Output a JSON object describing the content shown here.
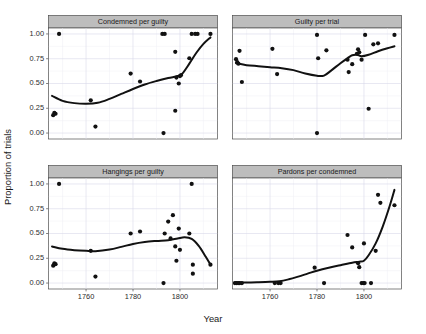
{
  "figure": {
    "xlabel": "Year",
    "ylabel": "Proportion of trials",
    "background": "#ffffff",
    "strip_fill": "#bdbdbd",
    "point_color": "#111111",
    "line_color": "#111111",
    "grid_color": "#d9d9ea"
  },
  "chart_data": {
    "type": "scatter",
    "title": "",
    "subtitle": "",
    "xlabel": "Year",
    "ylabel": "Proportion of trials",
    "xlim": [
      1744,
      1816
    ],
    "ylim": [
      -0.06,
      1.06
    ],
    "xticks": [
      1760,
      1780,
      1800
    ],
    "xtick_labels": [
      "1760",
      "1780",
      "1800"
    ],
    "yticks": [
      0.0,
      0.25,
      0.5,
      0.75,
      1.0
    ],
    "ytick_labels": [
      "0.00",
      "0.25",
      "0.50",
      "0.75",
      "1.00"
    ],
    "grid": true,
    "legend": "none",
    "facet_layout": [
      2,
      2
    ],
    "panels": [
      {
        "label": "Condemned per guilty",
        "row": 0,
        "col": 0,
        "points": [
          {
            "x": 1746,
            "y": 0.18
          },
          {
            "x": 1746.5,
            "y": 0.205
          },
          {
            "x": 1747,
            "y": 0.195
          },
          {
            "x": 1748.5,
            "y": 1.0
          },
          {
            "x": 1762,
            "y": 0.33
          },
          {
            "x": 1764,
            "y": 0.065
          },
          {
            "x": 1779,
            "y": 0.6
          },
          {
            "x": 1783,
            "y": 0.52
          },
          {
            "x": 1792.5,
            "y": 1.0
          },
          {
            "x": 1793.5,
            "y": 1.0
          },
          {
            "x": 1793,
            "y": 0.0
          },
          {
            "x": 1798,
            "y": 0.82
          },
          {
            "x": 1798,
            "y": 0.225
          },
          {
            "x": 1798.5,
            "y": 0.56
          },
          {
            "x": 1799.5,
            "y": 0.5
          },
          {
            "x": 1800,
            "y": 0.575
          },
          {
            "x": 1800.5,
            "y": 0.585
          },
          {
            "x": 1804,
            "y": 0.755
          },
          {
            "x": 1805,
            "y": 1.0
          },
          {
            "x": 1806.5,
            "y": 1.0
          },
          {
            "x": 1807.5,
            "y": 1.0
          },
          {
            "x": 1813,
            "y": 1.0
          }
        ],
        "smooth": [
          {
            "x": 1745.5,
            "y": 0.375
          },
          {
            "x": 1750,
            "y": 0.325
          },
          {
            "x": 1755,
            "y": 0.302
          },
          {
            "x": 1760,
            "y": 0.295
          },
          {
            "x": 1765,
            "y": 0.305
          },
          {
            "x": 1770,
            "y": 0.345
          },
          {
            "x": 1775,
            "y": 0.395
          },
          {
            "x": 1780,
            "y": 0.445
          },
          {
            "x": 1785,
            "y": 0.49
          },
          {
            "x": 1790,
            "y": 0.525
          },
          {
            "x": 1795,
            "y": 0.555
          },
          {
            "x": 1799,
            "y": 0.575
          },
          {
            "x": 1801,
            "y": 0.6
          },
          {
            "x": 1804,
            "y": 0.7
          },
          {
            "x": 1807,
            "y": 0.81
          },
          {
            "x": 1810,
            "y": 0.9
          },
          {
            "x": 1813,
            "y": 0.965
          }
        ]
      },
      {
        "label": "Guilty per trial",
        "row": 0,
        "col": 1,
        "points": [
          {
            "x": 1745.5,
            "y": 0.745
          },
          {
            "x": 1746,
            "y": 0.715
          },
          {
            "x": 1746.5,
            "y": 0.7
          },
          {
            "x": 1747,
            "y": 0.83
          },
          {
            "x": 1748,
            "y": 0.515
          },
          {
            "x": 1761,
            "y": 0.85
          },
          {
            "x": 1763,
            "y": 0.595
          },
          {
            "x": 1780,
            "y": 0.99
          },
          {
            "x": 1780.5,
            "y": 0.755
          },
          {
            "x": 1780,
            "y": 0.0
          },
          {
            "x": 1784,
            "y": 0.835
          },
          {
            "x": 1793,
            "y": 0.74
          },
          {
            "x": 1793.5,
            "y": 0.615
          },
          {
            "x": 1795,
            "y": 0.695
          },
          {
            "x": 1797,
            "y": 0.8
          },
          {
            "x": 1797.5,
            "y": 0.845
          },
          {
            "x": 1798,
            "y": 0.815
          },
          {
            "x": 1799,
            "y": 0.74
          },
          {
            "x": 1800.5,
            "y": 0.99
          },
          {
            "x": 1802,
            "y": 0.245
          },
          {
            "x": 1804,
            "y": 0.895
          },
          {
            "x": 1806,
            "y": 0.905
          },
          {
            "x": 1813,
            "y": 0.99
          }
        ],
        "smooth": [
          {
            "x": 1745.5,
            "y": 0.705
          },
          {
            "x": 1750,
            "y": 0.685
          },
          {
            "x": 1755,
            "y": 0.675
          },
          {
            "x": 1760,
            "y": 0.665
          },
          {
            "x": 1765,
            "y": 0.655
          },
          {
            "x": 1770,
            "y": 0.635
          },
          {
            "x": 1775,
            "y": 0.6
          },
          {
            "x": 1780,
            "y": 0.578
          },
          {
            "x": 1783,
            "y": 0.58
          },
          {
            "x": 1786,
            "y": 0.63
          },
          {
            "x": 1790,
            "y": 0.705
          },
          {
            "x": 1793,
            "y": 0.755
          },
          {
            "x": 1795,
            "y": 0.785
          },
          {
            "x": 1797,
            "y": 0.79
          },
          {
            "x": 1799,
            "y": 0.775
          },
          {
            "x": 1802,
            "y": 0.79
          },
          {
            "x": 1806,
            "y": 0.825
          },
          {
            "x": 1810,
            "y": 0.855
          },
          {
            "x": 1813,
            "y": 0.875
          }
        ]
      },
      {
        "label": "Hangings per guilty",
        "row": 1,
        "col": 0,
        "points": [
          {
            "x": 1746,
            "y": 0.175
          },
          {
            "x": 1746.5,
            "y": 0.2
          },
          {
            "x": 1747,
            "y": 0.19
          },
          {
            "x": 1748.5,
            "y": 1.0
          },
          {
            "x": 1762,
            "y": 0.325
          },
          {
            "x": 1764,
            "y": 0.065
          },
          {
            "x": 1779,
            "y": 0.5
          },
          {
            "x": 1783,
            "y": 0.52
          },
          {
            "x": 1793,
            "y": 0.0
          },
          {
            "x": 1793.5,
            "y": 0.5
          },
          {
            "x": 1795,
            "y": 0.62
          },
          {
            "x": 1796,
            "y": 0.45
          },
          {
            "x": 1797,
            "y": 0.685
          },
          {
            "x": 1798,
            "y": 0.37
          },
          {
            "x": 1798.5,
            "y": 0.225
          },
          {
            "x": 1799.5,
            "y": 0.55
          },
          {
            "x": 1800,
            "y": 0.335
          },
          {
            "x": 1804,
            "y": 0.5
          },
          {
            "x": 1805,
            "y": 1.0
          },
          {
            "x": 1805.5,
            "y": 0.185
          },
          {
            "x": 1805.5,
            "y": 0.095
          },
          {
            "x": 1813,
            "y": 0.185
          }
        ],
        "smooth": [
          {
            "x": 1745.5,
            "y": 0.368
          },
          {
            "x": 1750,
            "y": 0.345
          },
          {
            "x": 1755,
            "y": 0.332
          },
          {
            "x": 1760,
            "y": 0.325
          },
          {
            "x": 1764,
            "y": 0.322
          },
          {
            "x": 1770,
            "y": 0.338
          },
          {
            "x": 1775,
            "y": 0.365
          },
          {
            "x": 1780,
            "y": 0.395
          },
          {
            "x": 1785,
            "y": 0.415
          },
          {
            "x": 1790,
            "y": 0.425
          },
          {
            "x": 1795,
            "y": 0.432
          },
          {
            "x": 1799,
            "y": 0.45
          },
          {
            "x": 1802,
            "y": 0.462
          },
          {
            "x": 1805,
            "y": 0.445
          },
          {
            "x": 1808,
            "y": 0.375
          },
          {
            "x": 1811,
            "y": 0.265
          },
          {
            "x": 1813,
            "y": 0.185
          }
        ]
      },
      {
        "label": "Pardons per condemned",
        "row": 1,
        "col": 1,
        "points": [
          {
            "x": 1745,
            "y": 0.0
          },
          {
            "x": 1745.7,
            "y": 0.0
          },
          {
            "x": 1746.4,
            "y": 0.0
          },
          {
            "x": 1747.1,
            "y": 0.0
          },
          {
            "x": 1748,
            "y": 0.0
          },
          {
            "x": 1762,
            "y": 0.0
          },
          {
            "x": 1763.5,
            "y": 0.0
          },
          {
            "x": 1764.5,
            "y": 0.0
          },
          {
            "x": 1779,
            "y": 0.155
          },
          {
            "x": 1783,
            "y": 0.0
          },
          {
            "x": 1793,
            "y": 0.485
          },
          {
            "x": 1795,
            "y": 0.36
          },
          {
            "x": 1797.5,
            "y": 0.2
          },
          {
            "x": 1798,
            "y": 0.16
          },
          {
            "x": 1799,
            "y": 0.0
          },
          {
            "x": 1799.7,
            "y": 0.0
          },
          {
            "x": 1800.3,
            "y": 0.0
          },
          {
            "x": 1800,
            "y": 0.4
          },
          {
            "x": 1803,
            "y": 0.0
          },
          {
            "x": 1805,
            "y": 0.325
          },
          {
            "x": 1806,
            "y": 0.89
          },
          {
            "x": 1807,
            "y": 0.81
          },
          {
            "x": 1813,
            "y": 0.785
          }
        ],
        "smooth": [
          {
            "x": 1745,
            "y": 0.005
          },
          {
            "x": 1750,
            "y": 0.005
          },
          {
            "x": 1755,
            "y": 0.008
          },
          {
            "x": 1760,
            "y": 0.012
          },
          {
            "x": 1764,
            "y": 0.018
          },
          {
            "x": 1768,
            "y": 0.038
          },
          {
            "x": 1772,
            "y": 0.065
          },
          {
            "x": 1776,
            "y": 0.095
          },
          {
            "x": 1780,
            "y": 0.125
          },
          {
            "x": 1785,
            "y": 0.155
          },
          {
            "x": 1790,
            "y": 0.18
          },
          {
            "x": 1795,
            "y": 0.205
          },
          {
            "x": 1798,
            "y": 0.215
          },
          {
            "x": 1800,
            "y": 0.225
          },
          {
            "x": 1802,
            "y": 0.28
          },
          {
            "x": 1805,
            "y": 0.4
          },
          {
            "x": 1808,
            "y": 0.57
          },
          {
            "x": 1811,
            "y": 0.78
          },
          {
            "x": 1813,
            "y": 0.94
          }
        ]
      }
    ]
  }
}
